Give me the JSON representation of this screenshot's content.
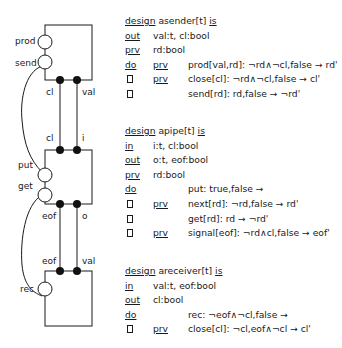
{
  "diagram": {
    "components": [
      {
        "name": "asender",
        "ports_left": [
          "prod",
          "send"
        ],
        "ports_bottom": [
          "cl",
          "val"
        ]
      },
      {
        "name": "apipe",
        "ports_top": [
          "cl",
          "i"
        ],
        "ports_left": [
          "put",
          "get"
        ],
        "ports_bottom": [
          "eof",
          "o"
        ]
      },
      {
        "name": "areceiver",
        "ports_top": [
          "eof",
          "val"
        ],
        "ports_left": [
          "rec"
        ]
      }
    ],
    "labels": {
      "prod": "prod",
      "send": "send",
      "cl1": "cl",
      "val1": "val",
      "cl2": "cl",
      "i": "i",
      "put": "put",
      "get": "get",
      "eof1": "eof",
      "o": "o",
      "eof2": "eof",
      "val2": "val",
      "rec": "rec"
    }
  },
  "designs": [
    {
      "header": {
        "kw1": "design",
        "name": " asender[t] ",
        "kw2": "is"
      },
      "lines": [
        {
          "kw": "out",
          "text": "val:t, cl:bool"
        },
        {
          "kw": "prv",
          "text": "rd:bool"
        },
        {
          "kw": "do",
          "prv": "prv",
          "text": "prod[val,rd]: ¬rd∧¬cl,false → rd'"
        },
        {
          "box": true,
          "prv": "prv",
          "text": "close[cl]: ¬rd∧¬cl,false → cl'"
        },
        {
          "box": true,
          "prv": "",
          "text": "send[rd]: rd,false → ¬rd'"
        }
      ]
    },
    {
      "header": {
        "kw1": "design",
        "name": " apipe[t] ",
        "kw2": "is"
      },
      "lines": [
        {
          "kw": "in",
          "text": "i:t, cl:bool"
        },
        {
          "kw": "out",
          "text": "o:t, eof:bool"
        },
        {
          "kw": "prv",
          "text": "rd:bool"
        },
        {
          "kw": "do",
          "prv": "",
          "text": "put: true,false →"
        },
        {
          "box": true,
          "prv": "prv",
          "text": "next[rd]: ¬rd,false → rd'"
        },
        {
          "box": true,
          "prv": "",
          "text": "get[rd]: rd → ¬rd'"
        },
        {
          "box": true,
          "prv": "prv",
          "text": "signal[eof]: ¬rd∧cl,false → eof'"
        }
      ]
    },
    {
      "header": {
        "kw1": "design",
        "name": " areceiver[t] ",
        "kw2": "is"
      },
      "lines": [
        {
          "kw": "in",
          "text": "val:t, eof:bool"
        },
        {
          "kw": "out",
          "text": "cl:bool"
        },
        {
          "kw": "do",
          "prv": "",
          "text": "rec: ¬eof∧¬cl,false →"
        },
        {
          "box": true,
          "prv": "prv",
          "text": "close[cl]: ¬cl,eof∧¬cl → cl'"
        }
      ]
    }
  ]
}
